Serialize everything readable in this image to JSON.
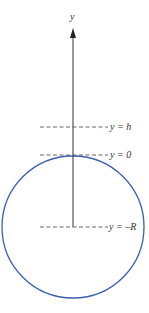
{
  "diagram": {
    "axis_label": "y",
    "levels": [
      {
        "id": "h",
        "label": "y = h",
        "y_px": 127
      },
      {
        "id": "zero",
        "label": "y = 0",
        "y_px": 155
      },
      {
        "id": "negR",
        "label": "y = –R",
        "y_px": 227
      }
    ],
    "circle": {
      "cx": 73,
      "cy": 227,
      "r": 71,
      "color": "#3a5fb0"
    },
    "axis_color": "#333333",
    "dash_color": "#555555"
  }
}
